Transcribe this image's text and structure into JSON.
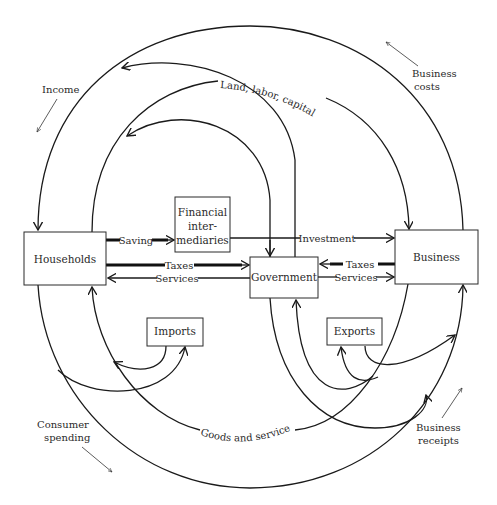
{
  "diagram": {
    "nodes": {
      "households": "Households",
      "financial_line1": "Financial",
      "financial_line2": "inter-",
      "financial_line3": "mediaries",
      "government": "Government",
      "business": "Business",
      "imports": "Imports",
      "exports": "Exports"
    },
    "flows": {
      "saving": "Saving",
      "investment": "Investment",
      "taxes_households": "Taxes",
      "services_households": "Services",
      "taxes_business": "Taxes",
      "services_business": "Services",
      "land_labor_capital": "Land, labor, capital",
      "goods_and_services": "Goods and services"
    },
    "annotations": {
      "income": "Income",
      "business_costs_line1": "Business",
      "business_costs_line2": "costs",
      "consumer_spending_line1": "Consumer",
      "consumer_spending_line2": "spending",
      "business_receipts_line1": "Business",
      "business_receipts_line2": "receipts"
    },
    "colors": {
      "line": "#1a1a1a",
      "background": "#ffffff"
    }
  }
}
